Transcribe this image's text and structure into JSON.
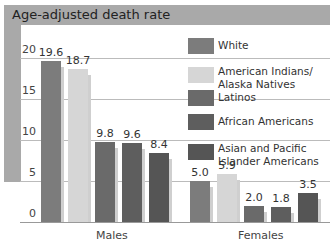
{
  "chart_data": {
    "type": "bar",
    "title": "Age-adjusted death rate",
    "xlabel": "",
    "ylabel": "Age-adjusted death rate",
    "categories": [
      "Males",
      "Females"
    ],
    "series": [
      {
        "name": "White",
        "values": [
          19.6,
          5.0
        ],
        "color": "#7c7c7c"
      },
      {
        "name": "American Indians/ Alaska Natives",
        "values": [
          18.7,
          5.9
        ],
        "color": "#d6d6d6"
      },
      {
        "name": "Latinos",
        "values": [
          9.8,
          2.0
        ],
        "color": "#6a6a6a"
      },
      {
        "name": "African Americans",
        "values": [
          9.6,
          1.8
        ],
        "color": "#5e5e5e"
      },
      {
        "name": "Asian and Pacific Islander Americans",
        "values": [
          8.4,
          3.5
        ],
        "color": "#555555"
      }
    ],
    "yticks": [
      "0",
      "5",
      "10",
      "15",
      "20"
    ],
    "ylim": [
      0,
      22
    ],
    "grid": true,
    "legend_position": "upper right"
  },
  "labels": {
    "title": "Age-adjusted death rate",
    "males": "Males",
    "females": "Females",
    "legend": [
      "White",
      "American Indians/",
      "Alaska Natives",
      "Latinos",
      "African Americans",
      "Asian and Pacific",
      "Islander Americans"
    ]
  }
}
